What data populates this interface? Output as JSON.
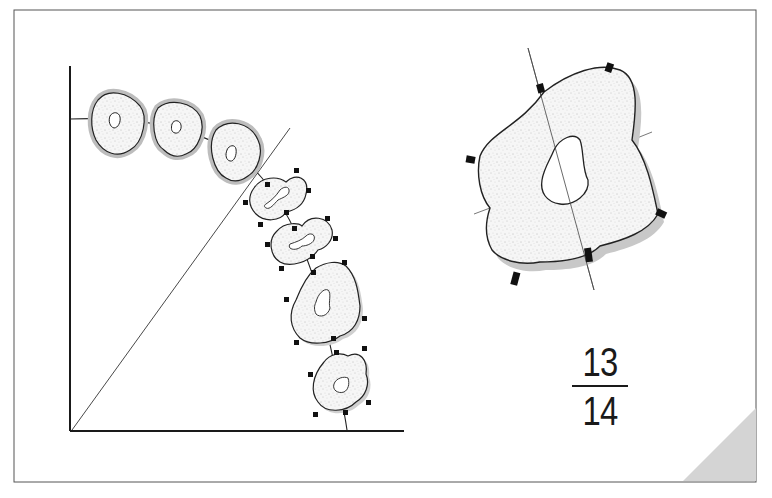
{
  "figure": {
    "page_label": {
      "numerator": "13",
      "denominator": "14"
    },
    "colors": {
      "frame": "#555555",
      "stroke": "#1a1a1a",
      "fill": "#f4f4f4",
      "halo": "#bdbdbd",
      "shadow": "#c8c8c8",
      "corner": "#d4d4d4",
      "marker": "#111111"
    },
    "left_panel": {
      "description": "Axes with a diagonal line and a curved path of eight stippled lobed shapes",
      "haloed_shapes_count": 3,
      "marked_shapes_count": 5
    },
    "right_panel": {
      "description": "Enlarged lobed shape with inner hole, crossing axis lines and black rectangular markers",
      "marker_count": 6
    }
  }
}
